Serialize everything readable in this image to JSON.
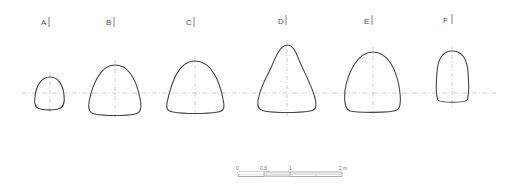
{
  "figure": {
    "type": "cross-section profiles",
    "stroke_color": "#444444",
    "axis_color": "#bbbbbb",
    "profiles": [
      {
        "label": "A",
        "label_x": 41,
        "cx": 50
      },
      {
        "label": "B",
        "label_x": 106,
        "cx": 115
      },
      {
        "label": "C",
        "label_x": 186,
        "cx": 195
      },
      {
        "label": "D",
        "label_x": 278,
        "cx": 287
      },
      {
        "label": "E",
        "label_x": 364,
        "cx": 373
      },
      {
        "label": "F",
        "label_x": 443,
        "cx": 452
      }
    ]
  },
  "scale_bar": {
    "ticks": [
      "0",
      "0,5",
      "1",
      "2 m"
    ]
  }
}
